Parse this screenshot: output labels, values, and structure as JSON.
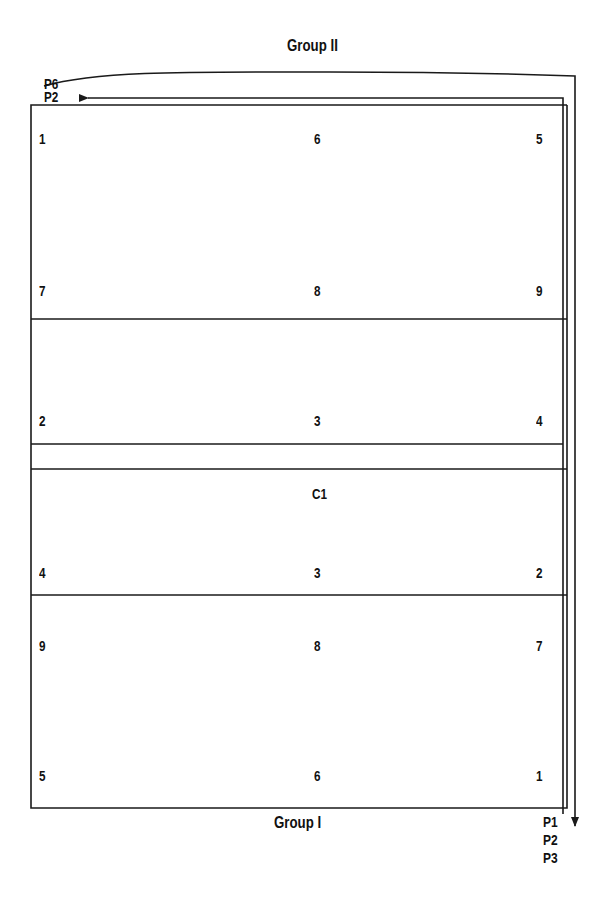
{
  "titles": {
    "top": "Group II",
    "bottom": "Group I"
  },
  "path_labels": {
    "top_curve": "P6",
    "top_arrow": "P2",
    "bottom": [
      "P1",
      "P2",
      "P3"
    ]
  },
  "sections": [
    {
      "name": "panel-top",
      "rows": [
        {
          "left": "1",
          "center": "6",
          "right": "5"
        },
        {
          "left": "7",
          "center": "8",
          "right": "9"
        }
      ]
    },
    {
      "name": "panel-upper-mid",
      "rows": [
        {
          "left": "2",
          "center": "3",
          "right": "4"
        }
      ]
    },
    {
      "name": "gap-strip",
      "rows": []
    },
    {
      "name": "panel-lower-mid",
      "rows": [
        {
          "center": "C1"
        },
        {
          "left": "4",
          "center": "3",
          "right": "2"
        }
      ]
    },
    {
      "name": "panel-bottom",
      "rows": [
        {
          "left": "9",
          "center": "8",
          "right": "7"
        },
        {
          "left": "5",
          "center": "6",
          "right": "1"
        }
      ]
    }
  ],
  "colors": {
    "line": "#1a1a1a",
    "background": "#ffffff"
  }
}
